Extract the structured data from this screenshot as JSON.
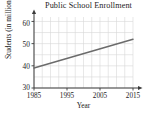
{
  "chart_data": {
    "type": "line",
    "title": "Public School Enrollment",
    "xlabel": "Year",
    "ylabel": "Students (in millions)",
    "x": [
      1985,
      2015
    ],
    "values": [
      39,
      52
    ],
    "series": [
      {
        "name": "Public School Enrollment",
        "x": [
          1985,
          2015
        ],
        "values": [
          39,
          52
        ]
      }
    ],
    "xticks": [
      1985,
      1995,
      2005,
      2015
    ],
    "yticks": [
      30,
      40,
      50,
      60
    ],
    "xtick_labels": [
      "1985",
      "1995",
      "2005",
      "2015"
    ],
    "ytick_labels": [
      "30",
      "40",
      "50",
      "60"
    ],
    "xlim": [
      1985,
      2015
    ],
    "ylim": [
      30,
      62
    ],
    "grid": true,
    "grid_x_step": 2.5,
    "grid_y_step": 5,
    "legend": null,
    "line_color": "#6b6b6b",
    "grid_color": "#d8d8d8",
    "axis_color": "#3a3a3a",
    "background_color": "#ffffff"
  }
}
